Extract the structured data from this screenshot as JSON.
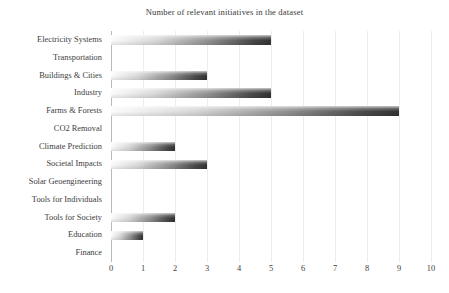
{
  "chart_data": {
    "type": "bar",
    "orientation": "horizontal",
    "title": "Number of relevant initiatives in the dataset",
    "xlabel": "",
    "ylabel": "",
    "categories": [
      "Electricity Systems",
      "Transportation",
      "Buildings & Cities",
      "Industry",
      "Farms & Forests",
      "CO2 Removal",
      "Climate Prediction",
      "Societal Impacts",
      "Solar Geoengineering",
      "Tools for Individuals",
      "Tools for Society",
      "Education",
      "Finance"
    ],
    "values": [
      5,
      0,
      3,
      5,
      9,
      0,
      2,
      3,
      0,
      0,
      2,
      1,
      0
    ],
    "xticks": [
      "0",
      "1",
      "2",
      "3",
      "4",
      "5",
      "6",
      "7",
      "8",
      "9",
      "10"
    ],
    "xtick_values": [
      0,
      1,
      2,
      3,
      4,
      5,
      6,
      7,
      8,
      9,
      10
    ],
    "xlim": [
      0,
      10
    ],
    "grid": "vertical",
    "legend": "none",
    "bar_gradient_start": "#fbfbfb",
    "bar_gradient_end": "#333333",
    "gridline_color": "#ededed",
    "axis_color": "#b9b9b9",
    "text_color": "#3d3d3d",
    "background": "#ffffff"
  }
}
